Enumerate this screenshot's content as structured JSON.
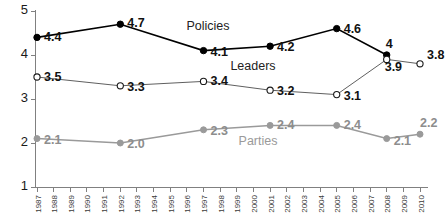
{
  "chart_data": {
    "type": "line",
    "title": "",
    "subtitle": "",
    "xlabel": "",
    "ylabel": "",
    "ylim": [
      1,
      5
    ],
    "yticks": [
      1,
      2,
      3,
      4,
      5
    ],
    "grid": false,
    "legend_position": "inline-annotations",
    "categories": [
      "1987",
      "1988",
      "1989",
      "1990",
      "1991",
      "1992",
      "1993",
      "1994",
      "1995",
      "1996",
      "1997",
      "1998",
      "1999",
      "2000",
      "2001",
      "2002",
      "2003",
      "2004",
      "2005",
      "2006",
      "2007",
      "2008",
      "2009",
      "2010"
    ],
    "series": [
      {
        "name": "Policies",
        "color": "#000000",
        "marker": "filled-circle",
        "x": [
          "1987",
          "1992",
          "1997",
          "2001",
          "2005",
          "2008"
        ],
        "values": [
          4.4,
          4.7,
          4.1,
          4.2,
          4.6,
          4.0
        ],
        "point_labels": [
          "4.4",
          "4.7",
          "4.1",
          "4.2",
          "4.6",
          "4"
        ]
      },
      {
        "name": "Leaders",
        "color": "#4d4d4d",
        "marker": "open-circle",
        "x": [
          "1987",
          "1992",
          "1997",
          "2001",
          "2005",
          "2008",
          "2010"
        ],
        "values": [
          3.5,
          3.3,
          3.4,
          3.2,
          3.1,
          3.9,
          3.8
        ],
        "point_labels": [
          "3.5",
          "3.3",
          "3.4",
          "3.2",
          "3.1",
          "3.9",
          "3.8"
        ]
      },
      {
        "name": "Parties",
        "color": "#9a9a9a",
        "marker": "filled-circle",
        "x": [
          "1987",
          "1992",
          "1997",
          "2001",
          "2005",
          "2008",
          "2010"
        ],
        "values": [
          2.1,
          2.0,
          2.3,
          2.4,
          2.4,
          2.1,
          2.2
        ],
        "point_labels": [
          "2.1",
          "2.0",
          "2.3",
          "2.4",
          "2.4",
          "2.1",
          "2.2"
        ]
      }
    ],
    "annotations": [
      {
        "text": "Policies",
        "series": "Policies"
      },
      {
        "text": "Leaders",
        "series": "Leaders"
      },
      {
        "text": "Parties",
        "series": "Parties"
      }
    ]
  },
  "axes": {
    "y_tick_labels": [
      "5",
      "4",
      "3",
      "2",
      "1"
    ],
    "x_tick_labels": [
      "1987",
      "1988",
      "1989",
      "1990",
      "1991",
      "1992",
      "1993",
      "1994",
      "1995",
      "1996",
      "1997",
      "1998",
      "1999",
      "2000",
      "2001",
      "2002",
      "2003",
      "2004",
      "2005",
      "2006",
      "2007",
      "2008",
      "2009",
      "2010"
    ]
  },
  "colors": {
    "policies": "#000000",
    "leaders": "#4d4d4d",
    "parties": "#9a9a9a",
    "axis": "#808080",
    "background": "#ffffff"
  }
}
